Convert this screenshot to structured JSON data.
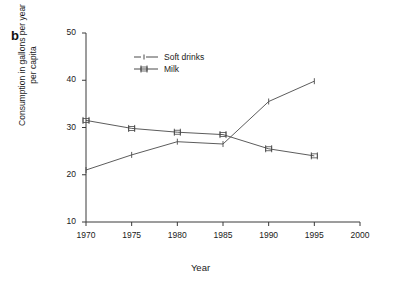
{
  "figure": {
    "panel_label": "b"
  },
  "axes": {
    "ylabel_line1": "Consumption in gallons per year",
    "ylabel_line2": "per capita",
    "xlabel": "Year",
    "yticks": [
      "50",
      "40",
      "30",
      "20",
      "10"
    ],
    "xticks": [
      "1970",
      "1975",
      "1980",
      "1985",
      "1990",
      "1995",
      "2000"
    ]
  },
  "legend": {
    "items": [
      {
        "label": "Soft drinks",
        "key": "dashed-line-marker"
      },
      {
        "label": "Milk",
        "key": "errorbar-line-marker"
      }
    ]
  },
  "colors": {
    "line": "#4a4a4a",
    "axis": "#3a3a3a",
    "text": "#1a1a1a",
    "background": "#ffffff"
  },
  "chart_data": {
    "type": "line",
    "title": "",
    "xlabel": "Year",
    "ylabel": "Consumption in gallons per year per capita",
    "x": [
      1970,
      1975,
      1980,
      1985,
      1990,
      1995
    ],
    "xlim": [
      1970,
      2000
    ],
    "ylim": [
      10,
      50
    ],
    "xtick_values": [
      1970,
      1975,
      1980,
      1985,
      1990,
      1995,
      2000
    ],
    "ytick_values": [
      10,
      20,
      30,
      40,
      50
    ],
    "grid": false,
    "legend_position": "upper-center",
    "series": [
      {
        "name": "Soft drinks",
        "values": [
          21.0,
          24.2,
          27.0,
          26.5,
          35.5,
          39.8
        ]
      },
      {
        "name": "Milk",
        "values": [
          31.5,
          29.8,
          29.0,
          28.5,
          25.5,
          24.0
        ]
      }
    ]
  }
}
